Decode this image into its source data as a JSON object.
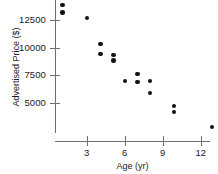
{
  "chart_data": {
    "type": "scatter",
    "title": "",
    "xlabel": "Age (yr)",
    "ylabel": "Advertised Price ($)",
    "xlim": [
      0,
      14
    ],
    "ylim": [
      2000,
      14500
    ],
    "xticks": [
      3,
      6,
      9,
      12
    ],
    "yticks": [
      5000,
      7500,
      10000,
      12500
    ],
    "xtick_labels": [
      "3",
      "6",
      "9",
      "12"
    ],
    "ytick_labels": [
      "5000",
      "7500",
      "10000",
      "12500"
    ],
    "grid": false,
    "legend": null,
    "series": [
      {
        "name": "Advertised Price vs Age",
        "marker": "filled-circle",
        "color": "#111111",
        "points": [
          {
            "x": 1.1,
            "y": 13850
          },
          {
            "x": 1.1,
            "y": 13200
          },
          {
            "x": 3.0,
            "y": 12680
          },
          {
            "x": 4.1,
            "y": 10320
          },
          {
            "x": 4.1,
            "y": 9400
          },
          {
            "x": 5.1,
            "y": 9320
          },
          {
            "x": 5.1,
            "y": 8820
          },
          {
            "x": 6.0,
            "y": 6950
          },
          {
            "x": 7.0,
            "y": 7590
          },
          {
            "x": 7.0,
            "y": 6860
          },
          {
            "x": 8.0,
            "y": 6950
          },
          {
            "x": 8.0,
            "y": 5860
          },
          {
            "x": 9.9,
            "y": 4680
          },
          {
            "x": 9.9,
            "y": 4140
          },
          {
            "x": 12.9,
            "y": 2770
          }
        ]
      }
    ]
  },
  "colors": {
    "axis": "#6e6e6e",
    "marker": "#111111",
    "text": "#1a1a1a",
    "background": "#ffffff"
  }
}
